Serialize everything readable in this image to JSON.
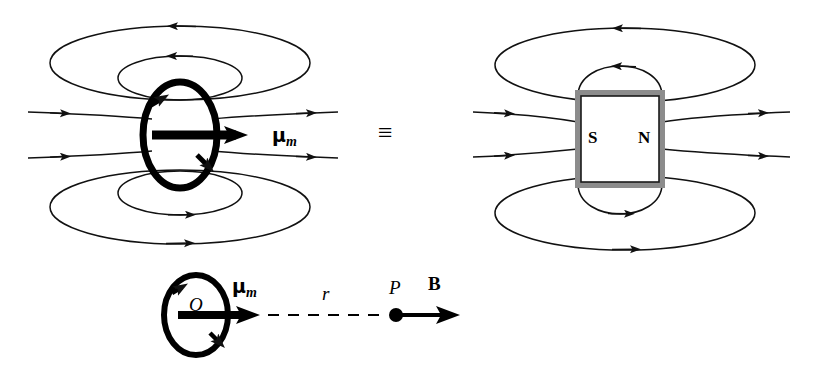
{
  "figure": {
    "equivalence_symbol": "≡",
    "colors": {
      "ink": "#000000",
      "field_line": "#1a1a1a",
      "magnet_body": "#ffffff",
      "magnet_edge_shadow": "#8c8c8c",
      "background": "#ffffff"
    }
  },
  "left_panel": {
    "name": "current-loop-dipole",
    "moment_label": "μ",
    "moment_subscript": "m",
    "loop_description": "current loop with circulating current",
    "field_lines": 8
  },
  "center": {
    "equivalence": "≡"
  },
  "right_panel": {
    "name": "bar-magnet-dipole",
    "south_pole_label": "S",
    "north_pole_label": "N",
    "field_lines": 8
  },
  "bottom_panel": {
    "name": "field-point-geometry",
    "origin_label": "O",
    "moment_label": "μ",
    "moment_subscript": "m",
    "distance_label": "r",
    "point_label": "P",
    "field_label": "B"
  }
}
